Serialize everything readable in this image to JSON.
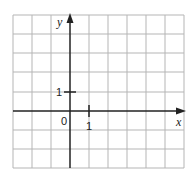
{
  "diagram": {
    "type": "coordinate-grid",
    "x_axis_label": "x",
    "y_axis_label": "y",
    "origin_label": "0",
    "x_tick_label": "1",
    "y_tick_label": "1",
    "grid": {
      "columns": 9,
      "rows": 8,
      "x_min": -3,
      "x_max": 6,
      "y_min": -3,
      "y_max": 5
    },
    "colors": {
      "grid": "#b5b5b5",
      "axis": "#222222"
    }
  }
}
